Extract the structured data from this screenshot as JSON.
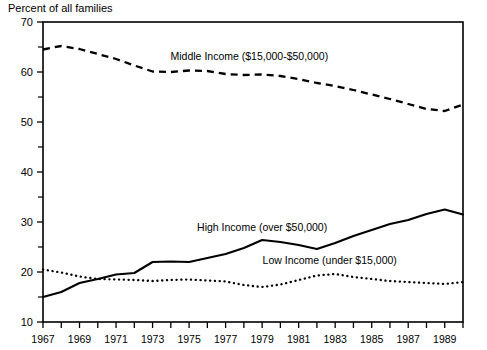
{
  "chart_data": {
    "type": "line",
    "title": "",
    "ylabel": "Percent of all families",
    "xlabel": "",
    "ylim": [
      10,
      70
    ],
    "xlim": [
      1967,
      1990
    ],
    "grid": false,
    "legend_position": "inline-annotations",
    "y_ticks_major": [
      10,
      20,
      30,
      40,
      50,
      60,
      70
    ],
    "y_ticks_minor": [
      15,
      25,
      35,
      45,
      55,
      65
    ],
    "x_ticks_all": [
      1967,
      1968,
      1969,
      1970,
      1971,
      1972,
      1973,
      1974,
      1975,
      1976,
      1977,
      1978,
      1979,
      1980,
      1981,
      1982,
      1983,
      1984,
      1985,
      1986,
      1987,
      1988,
      1989,
      1990
    ],
    "x_tick_labels": [
      "1967",
      "1969",
      "1971",
      "1973",
      "1975",
      "1977",
      "1979",
      "1981",
      "1983",
      "1985",
      "1987",
      "1989"
    ],
    "x_labeled_years": [
      1967,
      1969,
      1971,
      1973,
      1975,
      1977,
      1979,
      1981,
      1983,
      1985,
      1987,
      1989
    ],
    "x": [
      1967,
      1968,
      1969,
      1970,
      1971,
      1972,
      1973,
      1974,
      1975,
      1976,
      1977,
      1978,
      1979,
      1980,
      1981,
      1982,
      1983,
      1984,
      1985,
      1986,
      1987,
      1988,
      1989,
      1990
    ],
    "series": [
      {
        "name": "Middle Income ($15,000-$50,000)",
        "style": "dashed",
        "label_x": 1978.3,
        "label_y": 62.5,
        "values": [
          64.5,
          65.2,
          64.6,
          63.6,
          62.6,
          61.3,
          60.1,
          60.0,
          60.3,
          60.2,
          59.6,
          59.4,
          59.5,
          59.2,
          58.6,
          57.8,
          57.2,
          56.4,
          55.5,
          54.6,
          53.6,
          52.6,
          52.2,
          53.5
        ]
      },
      {
        "name": "High Income (over $50,000)",
        "style": "solid",
        "label_x": 1979.0,
        "label_y": 28.2,
        "values": [
          15.0,
          16.0,
          17.8,
          18.6,
          19.5,
          19.8,
          22.0,
          22.1,
          22.0,
          22.8,
          23.6,
          24.8,
          26.4,
          26.0,
          25.4,
          24.6,
          25.8,
          27.2,
          28.4,
          29.6,
          30.4,
          31.6,
          32.5,
          31.5
        ]
      },
      {
        "name": "Low Income (under $15,000)",
        "style": "dotted",
        "label_x": 1982.7,
        "label_y": 21.6,
        "values": [
          20.5,
          19.9,
          19.1,
          18.6,
          18.5,
          18.4,
          18.2,
          18.4,
          18.5,
          18.3,
          18.1,
          17.4,
          17.0,
          17.5,
          18.4,
          19.3,
          19.6,
          19.0,
          18.6,
          18.2,
          18.0,
          17.8,
          17.6,
          18.0
        ]
      }
    ]
  }
}
